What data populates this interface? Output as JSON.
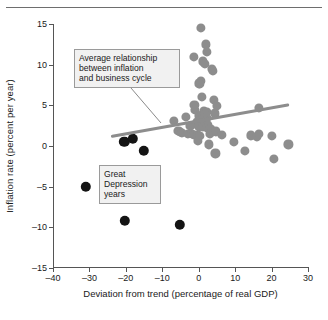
{
  "figure": {
    "top_rule": true,
    "background": "#ffffff"
  },
  "chart_data": {
    "type": "scatter",
    "title": "",
    "xlabel": "Deviation from trend (percentage of real GDP)",
    "ylabel": "Inflation rate (percent per year)",
    "xlim": [
      -40,
      30
    ],
    "ylim": [
      -15,
      15
    ],
    "xticks": [
      -40,
      -30,
      -20,
      -10,
      0,
      10,
      20,
      30
    ],
    "xticklabels": [
      "–40",
      "–30",
      "–20",
      "–10",
      "0",
      "10",
      "20",
      "30"
    ],
    "yticks": [
      -15,
      -10,
      -5,
      0,
      5,
      10,
      15
    ],
    "yticklabels": [
      "–15",
      "–10",
      "–5",
      "0",
      "5",
      "10",
      "15"
    ],
    "grid": false,
    "legend": "none",
    "colors": {
      "normal_years": "#8d8d8d",
      "depression_years": "#141414",
      "trend_line": "#8d8d8d",
      "axis": "#555555",
      "annotation_fill": "#f1f1f1",
      "annotation_border": "#9a9a9a"
    },
    "series": [
      {
        "name": "Great Depression years",
        "color": "#141414",
        "marker": "circle",
        "marker_size": 5.2,
        "points": [
          {
            "x": -20.4,
            "y": 0.5
          },
          {
            "x": -18.1,
            "y": 0.9
          },
          {
            "x": -15.0,
            "y": -0.6
          },
          {
            "x": -31.0,
            "y": -5.0
          },
          {
            "x": -20.3,
            "y": -9.2
          },
          {
            "x": -5.2,
            "y": -9.7
          }
        ]
      },
      {
        "name": "Normal years",
        "color": "#8d8d8d",
        "marker": "circle",
        "marker_size": 4.6,
        "points": [
          {
            "x": 0.6,
            "y": 14.5
          },
          {
            "x": 2.0,
            "y": 12.5
          },
          {
            "x": 2.2,
            "y": 11.6
          },
          {
            "x": -1.4,
            "y": 11.0
          },
          {
            "x": 1.2,
            "y": 10.4
          },
          {
            "x": 1.6,
            "y": 10.1
          },
          {
            "x": 3.6,
            "y": 9.5
          },
          {
            "x": 3.9,
            "y": 9.2
          },
          {
            "x": 0.6,
            "y": 8.0
          },
          {
            "x": 0.0,
            "y": 7.7
          },
          {
            "x": 0.3,
            "y": 7.6
          },
          {
            "x": 0.9,
            "y": 6.0
          },
          {
            "x": 4.1,
            "y": 5.7
          },
          {
            "x": -1.2,
            "y": 5.1
          },
          {
            "x": 5.0,
            "y": 4.9
          },
          {
            "x": 16.5,
            "y": 4.7
          },
          {
            "x": -1.0,
            "y": 4.4
          },
          {
            "x": 1.4,
            "y": 4.3
          },
          {
            "x": 2.3,
            "y": 4.2
          },
          {
            "x": 4.4,
            "y": 4.0
          },
          {
            "x": -3.5,
            "y": 3.6
          },
          {
            "x": 0.2,
            "y": 3.7
          },
          {
            "x": 1.0,
            "y": 3.8
          },
          {
            "x": 1.6,
            "y": 3.9
          },
          {
            "x": 2.1,
            "y": 3.5
          },
          {
            "x": 1.3,
            "y": 3.3
          },
          {
            "x": 0.5,
            "y": 3.2
          },
          {
            "x": 1.9,
            "y": 3.1
          },
          {
            "x": -6.7,
            "y": 3.1
          },
          {
            "x": -0.5,
            "y": 2.9
          },
          {
            "x": 0.8,
            "y": 2.8
          },
          {
            "x": 1.7,
            "y": 2.7
          },
          {
            "x": 2.6,
            "y": 2.6
          },
          {
            "x": -2.3,
            "y": 2.5
          },
          {
            "x": 0.1,
            "y": 2.4
          },
          {
            "x": 1.1,
            "y": 2.3
          },
          {
            "x": 2.4,
            "y": 2.2
          },
          {
            "x": 3.2,
            "y": 2.1
          },
          {
            "x": -5.6,
            "y": 1.9
          },
          {
            "x": -5.2,
            "y": 1.7
          },
          {
            "x": -4.6,
            "y": 1.6
          },
          {
            "x": -2.9,
            "y": 1.5
          },
          {
            "x": -1.8,
            "y": 1.5
          },
          {
            "x": -1.2,
            "y": 1.4
          },
          {
            "x": -0.3,
            "y": 1.3
          },
          {
            "x": 0.4,
            "y": 1.2
          },
          {
            "x": 3.0,
            "y": 1.5
          },
          {
            "x": 4.8,
            "y": 1.8
          },
          {
            "x": 6.4,
            "y": 1.4
          },
          {
            "x": 14.4,
            "y": 1.3
          },
          {
            "x": 16.0,
            "y": 1.1
          },
          {
            "x": 16.6,
            "y": 1.5
          },
          {
            "x": 20.2,
            "y": 1.2
          },
          {
            "x": 24.6,
            "y": 0.2
          },
          {
            "x": 9.7,
            "y": 0.5
          },
          {
            "x": 2.9,
            "y": 0.2
          },
          {
            "x": -0.2,
            "y": 0.6
          },
          {
            "x": 12.7,
            "y": -0.6
          },
          {
            "x": 4.6,
            "y": -0.9
          },
          {
            "x": 20.6,
            "y": -1.6
          }
        ]
      }
    ],
    "trend_line": {
      "label": "Average relationship between inflation and business cycle",
      "x_start": -24.0,
      "y_start": 1.3,
      "x_end": 25.0,
      "y_end": 5.2,
      "color": "#8d8d8d"
    },
    "annotations": [
      {
        "id": "trend-annotation",
        "text": "Average relationship\nbetween inflation\nand business cycle",
        "leader_from": {
          "x_px": 131,
          "y_px": 88
        },
        "leader_to": {
          "x_px": 161,
          "y_px": 123
        }
      },
      {
        "id": "depression-annotation",
        "text": "Great\nDepression\nyears"
      }
    ]
  }
}
